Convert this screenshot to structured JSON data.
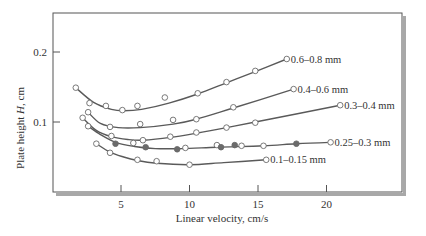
{
  "chart_data": {
    "type": "line",
    "title": "",
    "xlabel": "Linear velocity, cm/s",
    "ylabel_prefix": "Plate height ",
    "ylabel_var": "H",
    "ylabel_suffix": ", cm",
    "xlim": [
      0,
      22.5
    ],
    "ylim": [
      0,
      0.25
    ],
    "x_ticks": [
      5,
      10,
      15,
      20
    ],
    "x_tick_labels": [
      "5",
      "10",
      "15",
      "20"
    ],
    "y_ticks": [
      0.1,
      0.2
    ],
    "y_tick_labels": [
      "0.1",
      "0.2"
    ],
    "grid": false,
    "legend": "inline labels at end of each curve",
    "series": [
      {
        "name": "0.6–0.8 mm",
        "points": [
          {
            "x": 1.7,
            "y": 0.149,
            "filled": false
          },
          {
            "x": 2.7,
            "y": 0.127,
            "filled": false
          },
          {
            "x": 3.9,
            "y": 0.123,
            "filled": false
          },
          {
            "x": 5.1,
            "y": 0.117,
            "filled": false
          },
          {
            "x": 6.2,
            "y": 0.123,
            "filled": false
          },
          {
            "x": 8.2,
            "y": 0.135,
            "filled": false
          },
          {
            "x": 10.6,
            "y": 0.141,
            "filled": false
          },
          {
            "x": 12.7,
            "y": 0.157,
            "filled": false
          },
          {
            "x": 14.8,
            "y": 0.173,
            "filled": false
          },
          {
            "x": 17.1,
            "y": 0.19,
            "filled": false
          }
        ],
        "curve": [
          [
            1.7,
            0.149
          ],
          [
            3.0,
            0.128
          ],
          [
            4.3,
            0.118
          ],
          [
            5.2,
            0.116
          ],
          [
            6.5,
            0.118
          ],
          [
            8.5,
            0.127
          ],
          [
            10.6,
            0.14
          ],
          [
            12.7,
            0.156
          ],
          [
            14.8,
            0.172
          ],
          [
            17.1,
            0.19
          ]
        ]
      },
      {
        "name": "0.4–0.6 mm",
        "points": [
          {
            "x": 2.6,
            "y": 0.114,
            "filled": false
          },
          {
            "x": 4.2,
            "y": 0.093,
            "filled": false
          },
          {
            "x": 6.4,
            "y": 0.097,
            "filled": false
          },
          {
            "x": 8.8,
            "y": 0.103,
            "filled": false
          },
          {
            "x": 10.5,
            "y": 0.104,
            "filled": false
          },
          {
            "x": 13.2,
            "y": 0.121,
            "filled": false
          },
          {
            "x": 17.6,
            "y": 0.147,
            "filled": false
          }
        ],
        "curve": [
          [
            2.6,
            0.114
          ],
          [
            3.5,
            0.098
          ],
          [
            4.8,
            0.092
          ],
          [
            6.4,
            0.092
          ],
          [
            8.8,
            0.097
          ],
          [
            10.5,
            0.104
          ],
          [
            13.2,
            0.12
          ],
          [
            17.6,
            0.147
          ]
        ]
      },
      {
        "name": "0.3–0.4 mm",
        "points": [
          {
            "x": 2.2,
            "y": 0.106,
            "filled": false
          },
          {
            "x": 4.3,
            "y": 0.08,
            "filled": false
          },
          {
            "x": 6.6,
            "y": 0.074,
            "filled": false
          },
          {
            "x": 8.6,
            "y": 0.079,
            "filled": false
          },
          {
            "x": 10.5,
            "y": 0.085,
            "filled": false
          },
          {
            "x": 12.7,
            "y": 0.092,
            "filled": false
          },
          {
            "x": 14.8,
            "y": 0.099,
            "filled": false
          },
          {
            "x": 21.0,
            "y": 0.124,
            "filled": false
          }
        ],
        "curve": [
          [
            2.2,
            0.106
          ],
          [
            3.2,
            0.088
          ],
          [
            4.3,
            0.079
          ],
          [
            5.5,
            0.075
          ],
          [
            6.6,
            0.074
          ],
          [
            8.6,
            0.078
          ],
          [
            10.5,
            0.084
          ],
          [
            12.7,
            0.092
          ],
          [
            14.8,
            0.1
          ],
          [
            21.0,
            0.124
          ]
        ]
      },
      {
        "name": "0.25–0.3 mm",
        "points": [
          {
            "x": 2.6,
            "y": 0.094,
            "filled": false
          },
          {
            "x": 4.6,
            "y": 0.069,
            "filled": true
          },
          {
            "x": 5.9,
            "y": 0.07,
            "filled": false
          },
          {
            "x": 6.8,
            "y": 0.064,
            "filled": true
          },
          {
            "x": 9.1,
            "y": 0.061,
            "filled": true
          },
          {
            "x": 9.7,
            "y": 0.063,
            "filled": false
          },
          {
            "x": 12.0,
            "y": 0.067,
            "filled": false
          },
          {
            "x": 12.3,
            "y": 0.064,
            "filled": true
          },
          {
            "x": 13.3,
            "y": 0.067,
            "filled": true
          },
          {
            "x": 13.8,
            "y": 0.066,
            "filled": false
          },
          {
            "x": 15.4,
            "y": 0.066,
            "filled": false
          },
          {
            "x": 17.8,
            "y": 0.069,
            "filled": true
          },
          {
            "x": 20.3,
            "y": 0.071,
            "filled": false
          }
        ],
        "curve": [
          [
            2.6,
            0.094
          ],
          [
            3.5,
            0.082
          ],
          [
            4.6,
            0.071
          ],
          [
            6.0,
            0.065
          ],
          [
            7.5,
            0.062
          ],
          [
            9.4,
            0.062
          ],
          [
            12.0,
            0.064
          ],
          [
            15.4,
            0.066
          ],
          [
            17.8,
            0.069
          ],
          [
            20.3,
            0.071
          ]
        ]
      },
      {
        "name": "0.1–0.15 mm",
        "points": [
          {
            "x": 3.2,
            "y": 0.069,
            "filled": false
          },
          {
            "x": 4.2,
            "y": 0.056,
            "filled": false
          },
          {
            "x": 6.2,
            "y": 0.046,
            "filled": false
          },
          {
            "x": 7.6,
            "y": 0.044,
            "filled": false
          },
          {
            "x": 10.0,
            "y": 0.039,
            "filled": false
          },
          {
            "x": 15.6,
            "y": 0.046,
            "filled": false
          }
        ],
        "curve": [
          [
            3.2,
            0.069
          ],
          [
            4.2,
            0.057
          ],
          [
            5.2,
            0.05
          ],
          [
            6.2,
            0.045
          ],
          [
            7.6,
            0.041
          ],
          [
            10.0,
            0.039
          ],
          [
            12.5,
            0.042
          ],
          [
            15.6,
            0.046
          ]
        ]
      }
    ]
  },
  "style": {
    "line_color": "#5a5a5a",
    "marker_edge": "#6a6a6a",
    "marker_fill_hollow": "#ffffff",
    "marker_fill_solid": "#6b6b6b",
    "frame_color": "#555555",
    "shadow_color": "#9a9a9a",
    "text_color": "#333333"
  }
}
